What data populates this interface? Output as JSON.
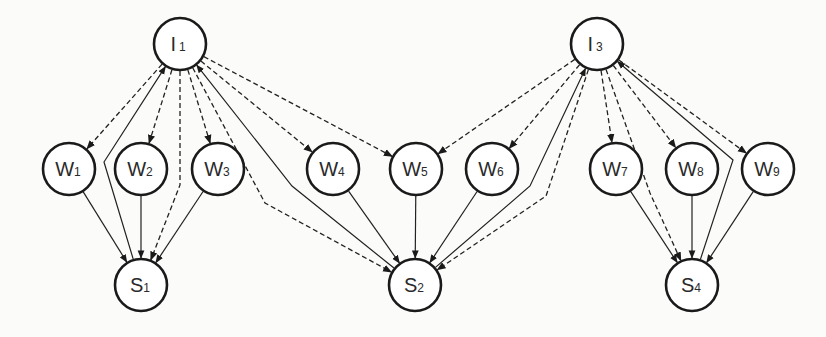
{
  "diagram": {
    "type": "directed-graph",
    "node_radius": 26,
    "colors": {
      "stroke": "#1a1a1a",
      "fill": "#ffffff",
      "background": "#fbfbf9",
      "text": "#2a2a2a"
    },
    "nodes": [
      {
        "id": "I1",
        "letter": "I",
        "sub": "1",
        "x": 180,
        "y": 44
      },
      {
        "id": "I3",
        "letter": "I",
        "sub": "3",
        "x": 597,
        "y": 44
      },
      {
        "id": "W1",
        "letter": "W",
        "sub": "1",
        "x": 69,
        "y": 169
      },
      {
        "id": "W2",
        "letter": "W",
        "sub": "2",
        "x": 141,
        "y": 169
      },
      {
        "id": "W3",
        "letter": "W",
        "sub": "3",
        "x": 218,
        "y": 169
      },
      {
        "id": "W4",
        "letter": "W",
        "sub": "4",
        "x": 333,
        "y": 169
      },
      {
        "id": "W5",
        "letter": "W",
        "sub": "5",
        "x": 416,
        "y": 169
      },
      {
        "id": "W6",
        "letter": "W",
        "sub": "6",
        "x": 492,
        "y": 169
      },
      {
        "id": "W7",
        "letter": "W",
        "sub": "7",
        "x": 616,
        "y": 169
      },
      {
        "id": "W8",
        "letter": "W",
        "sub": "8",
        "x": 692,
        "y": 169
      },
      {
        "id": "W9",
        "letter": "W",
        "sub": "9",
        "x": 768,
        "y": 169
      },
      {
        "id": "S1",
        "letter": "S",
        "sub": "1",
        "x": 141,
        "y": 285
      },
      {
        "id": "S2",
        "letter": "S",
        "sub": "2",
        "x": 415,
        "y": 285
      },
      {
        "id": "S4",
        "letter": "S",
        "sub": "4",
        "x": 692,
        "y": 285
      }
    ],
    "edges": [
      {
        "from": "I1",
        "to": "W1",
        "style": "dashed"
      },
      {
        "from": "I1",
        "to": "W2",
        "style": "dashed"
      },
      {
        "from": "I1",
        "to": "W3",
        "style": "dashed"
      },
      {
        "from": "I1",
        "to": "W4",
        "style": "dashed"
      },
      {
        "from": "I1",
        "to": "W5",
        "style": "dashed"
      },
      {
        "from": "I1",
        "to": "S1",
        "style": "dashed",
        "via": [
          [
            180,
            185
          ]
        ]
      },
      {
        "from": "S1",
        "to": "I1",
        "style": "solid",
        "via": [
          [
            104,
            162
          ]
        ]
      },
      {
        "from": "I1",
        "to": "S2",
        "style": "dashed",
        "via": [
          [
            265,
            203
          ]
        ]
      },
      {
        "from": "S2",
        "to": "I1",
        "style": "solid",
        "via": [
          [
            292,
            186
          ]
        ]
      },
      {
        "from": "I3",
        "to": "W5",
        "style": "dashed"
      },
      {
        "from": "I3",
        "to": "W6",
        "style": "dashed"
      },
      {
        "from": "I3",
        "to": "W7",
        "style": "dashed"
      },
      {
        "from": "I3",
        "to": "W8",
        "style": "dashed"
      },
      {
        "from": "I3",
        "to": "W9",
        "style": "dashed"
      },
      {
        "from": "S2",
        "to": "I3",
        "style": "solid",
        "via": [
          [
            530,
            186
          ]
        ]
      },
      {
        "from": "I3",
        "to": "S2",
        "style": "dashed",
        "via": [
          [
            546,
            196
          ]
        ]
      },
      {
        "from": "I3",
        "to": "S4",
        "style": "dashed",
        "via": [
          [
            650,
            193
          ]
        ]
      },
      {
        "from": "S4",
        "to": "I3",
        "style": "solid",
        "via": [
          [
            733,
            160
          ]
        ]
      },
      {
        "from": "W1",
        "to": "S1",
        "style": "solid"
      },
      {
        "from": "W2",
        "to": "S1",
        "style": "solid"
      },
      {
        "from": "W3",
        "to": "S1",
        "style": "solid"
      },
      {
        "from": "W4",
        "to": "S2",
        "style": "solid"
      },
      {
        "from": "W5",
        "to": "S2",
        "style": "solid"
      },
      {
        "from": "W6",
        "to": "S2",
        "style": "solid"
      },
      {
        "from": "W7",
        "to": "S4",
        "style": "solid"
      },
      {
        "from": "W8",
        "to": "S4",
        "style": "solid"
      },
      {
        "from": "W9",
        "to": "S4",
        "style": "solid"
      }
    ],
    "legend": []
  }
}
